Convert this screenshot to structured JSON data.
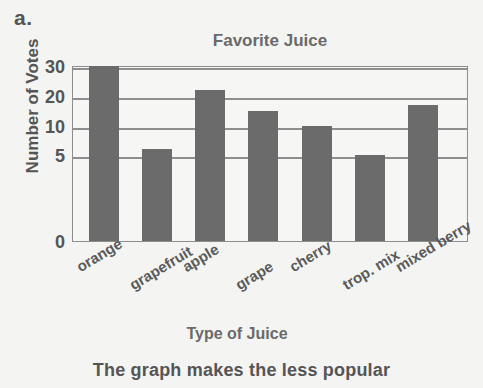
{
  "figure": {
    "item_letter": "a.",
    "caption": "The graph makes the less popular"
  },
  "colors": {
    "bar": "#6b6b6b",
    "axis": "#8e8e8e",
    "background": "#f4f4f2",
    "text": "#555555"
  },
  "chart_data": {
    "type": "bar",
    "title": "Favorite Juice",
    "xlabel": "Type of Juice",
    "ylabel": "Number of Votes",
    "categories": [
      "orange",
      "grapefruit",
      "apple",
      "grape",
      "cherry",
      "trop. mix",
      "mixed berry"
    ],
    "values": [
      30,
      6,
      22,
      15,
      10,
      5,
      17
    ],
    "yticks": [
      0,
      5,
      10,
      20,
      30
    ],
    "ylim": [
      0,
      30
    ],
    "grid": true,
    "legend": null,
    "note": "y-axis uses non-uniform (broken) spacing: 0,5,10,20,30"
  }
}
